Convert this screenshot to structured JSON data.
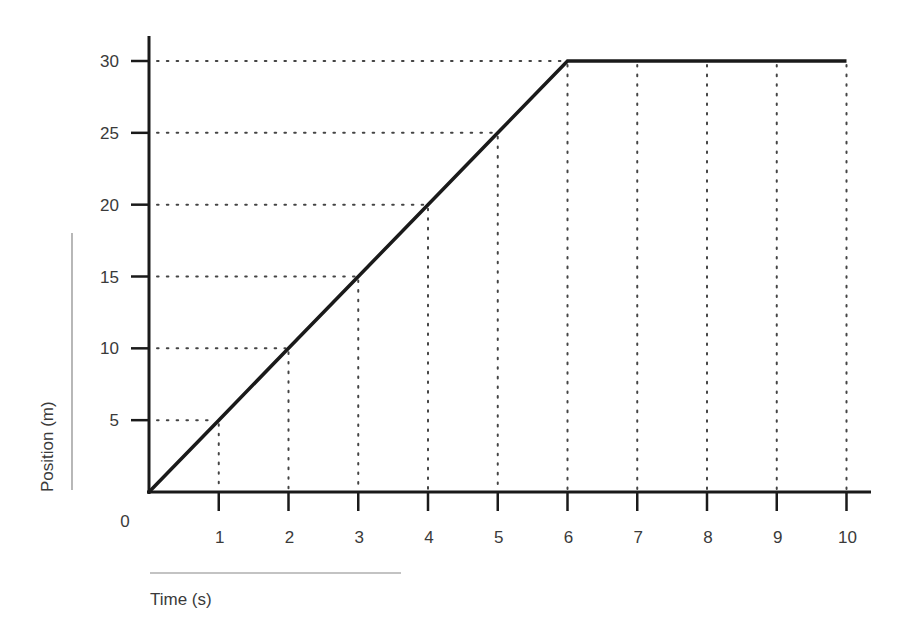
{
  "chart_data": {
    "type": "line",
    "title": "",
    "xlabel": "Time (s)",
    "ylabel": "Position (m)",
    "x": [
      0,
      1,
      2,
      3,
      4,
      5,
      6,
      7,
      8,
      9,
      10
    ],
    "series": [
      {
        "name": "Position",
        "values": [
          0,
          5,
          10,
          15,
          20,
          25,
          30,
          30,
          30,
          30,
          30
        ]
      }
    ],
    "xlim": [
      0,
      10
    ],
    "ylim": [
      0,
      30
    ],
    "x_ticks": [
      1,
      2,
      3,
      4,
      5,
      6,
      7,
      8,
      9,
      10
    ],
    "y_ticks": [
      5,
      10,
      15,
      20,
      25,
      30
    ],
    "origin_label": "0",
    "grid": "dotted guide lines from each data point to both axes",
    "legend": "none",
    "colors": {
      "line": "#1a1a1a",
      "axis": "#1a1a1a",
      "grid": "#444444",
      "text": "#3a3a3a",
      "underline": "#888888"
    }
  }
}
